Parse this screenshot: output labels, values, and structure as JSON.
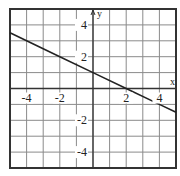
{
  "chart_data": {
    "type": "line",
    "title": "",
    "xlabel": "x",
    "ylabel": "y",
    "xlim": [
      -5,
      5
    ],
    "ylim": [
      -5,
      5
    ],
    "grid": true,
    "grid_step": 1,
    "x_ticks": [
      -4,
      -2,
      2,
      4
    ],
    "y_ticks": [
      4,
      2,
      -2,
      -4
    ],
    "x_tick_labels": [
      "-4",
      "-2",
      "2",
      "4"
    ],
    "y_tick_labels": [
      "4",
      "2",
      "-2",
      "-4"
    ],
    "series": [
      {
        "name": "y = -1/2 x + 1",
        "equation": "y = -0.5x + 1",
        "x": [
          -5,
          -4,
          -2,
          0,
          2,
          4,
          5
        ],
        "y": [
          3.5,
          3,
          2,
          1,
          0,
          -1,
          -1.5
        ]
      }
    ],
    "legend": null
  },
  "colors": {
    "frame": "#333333",
    "grid": "#8a8a8a",
    "axis": "#333333",
    "line": "#222222",
    "background": "#ffffff"
  }
}
